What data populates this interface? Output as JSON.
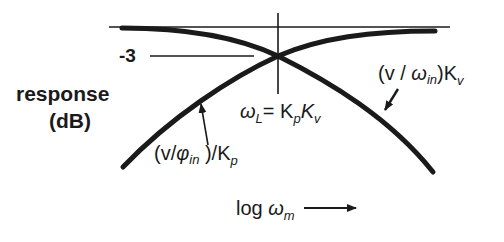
{
  "diagram": {
    "y_axis_label_line1": "response",
    "y_axis_label_line2": "(dB)",
    "minus3_label": "-3",
    "crossover": {
      "omega": "ω",
      "omega_sub": "L",
      "eq": "= K",
      "kp_sub": "p",
      "kv": "K",
      "kv_sub": "v"
    },
    "left_curve_label": {
      "open": "(v/",
      "phi": "φ",
      "phi_sub": "in",
      "close": " )/K",
      "k_sub": "p"
    },
    "right_curve_label": {
      "open": "(v / ",
      "omega": "ω",
      "omega_sub": "in",
      "close": ")K",
      "k_sub": "v"
    },
    "x_axis_label": {
      "log": "log ",
      "omega": "ω",
      "omega_sub": "m"
    },
    "colors": {
      "ink": "#1a1a1a",
      "background": "#ffffff"
    }
  }
}
